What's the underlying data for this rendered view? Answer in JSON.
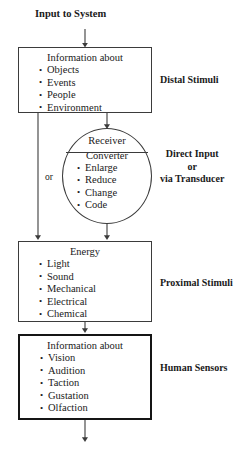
{
  "diagram": {
    "title": "Input to System",
    "nodes": {
      "distal": {
        "heading": "Information about",
        "items": [
          "Objects",
          "Events",
          "People",
          "Environment"
        ],
        "stage_label": "Distal Stimuli"
      },
      "receiver": {
        "heading": "Receiver",
        "subheading": "Converter",
        "items": [
          "Enlarge",
          "Reduce",
          "Change",
          "Code"
        ],
        "stage_label_line1": "Direct Input",
        "stage_label_line2": "or",
        "stage_label_line3": "via Transducer"
      },
      "proximal": {
        "heading": "Energy",
        "items": [
          "Light",
          "Sound",
          "Mechanical",
          "Electrical",
          "Chemical"
        ],
        "stage_label": "Proximal Stimuli"
      },
      "sensors": {
        "heading": "Information about",
        "items": [
          "Vision",
          "Audition",
          "Taction",
          "Gustation",
          "Olfaction"
        ],
        "stage_label": "Human Sensors"
      }
    },
    "branch_label": "or",
    "colors": {
      "line": "#3b3b3b",
      "thick_border": "#151515",
      "text": "#1a1a1a",
      "background": "#ffffff"
    }
  }
}
